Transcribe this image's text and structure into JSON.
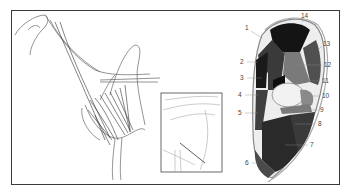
{
  "figure": {
    "panels": [
      {
        "id": "lateral-view",
        "description": "Line drawing of animal shoulder/forelimb with tendons and muscles"
      },
      {
        "id": "inset-detail",
        "description": "Boxed close-up of joint region"
      },
      {
        "id": "cross-section",
        "description": "Cross-section of limb with numbered muscle regions"
      }
    ],
    "cross_section_labels": [
      "1",
      "2",
      "3",
      "4",
      "5",
      "6",
      "7",
      "8",
      "9",
      "10",
      "11",
      "12",
      "13",
      "14"
    ],
    "colors": {
      "border": "#3a3a3a",
      "dark_muscle": "#1a1a1a",
      "mid_muscle": "#4a4a4a",
      "light_muscle": "#8a8a8a",
      "bone": "#e8e8e8",
      "line": "#555555"
    }
  }
}
